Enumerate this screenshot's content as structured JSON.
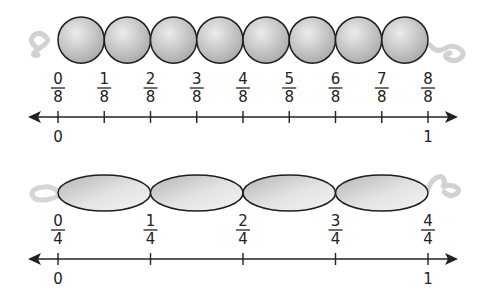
{
  "colors": {
    "ink": "#222222",
    "bead_fill_light": "#e6e6e6",
    "bead_fill_dark": "#a9a9a9",
    "string": "#cfcfcf"
  },
  "top_model": {
    "name": "eighths",
    "bead_shape": "circle",
    "bead_count": 8,
    "fractions": [
      {
        "num": "0",
        "den": "8"
      },
      {
        "num": "1",
        "den": "8"
      },
      {
        "num": "2",
        "den": "8"
      },
      {
        "num": "3",
        "den": "8"
      },
      {
        "num": "4",
        "den": "8"
      },
      {
        "num": "5",
        "den": "8"
      },
      {
        "num": "6",
        "den": "8"
      },
      {
        "num": "7",
        "den": "8"
      },
      {
        "num": "8",
        "den": "8"
      }
    ],
    "axis_labels": {
      "start": "0",
      "end": "1"
    }
  },
  "bottom_model": {
    "name": "fourths",
    "bead_shape": "ellipse",
    "bead_count": 4,
    "fractions": [
      {
        "num": "0",
        "den": "4"
      },
      {
        "num": "1",
        "den": "4"
      },
      {
        "num": "2",
        "den": "4"
      },
      {
        "num": "3",
        "den": "4"
      },
      {
        "num": "4",
        "den": "4"
      }
    ],
    "axis_labels": {
      "start": "0",
      "end": "1"
    }
  }
}
